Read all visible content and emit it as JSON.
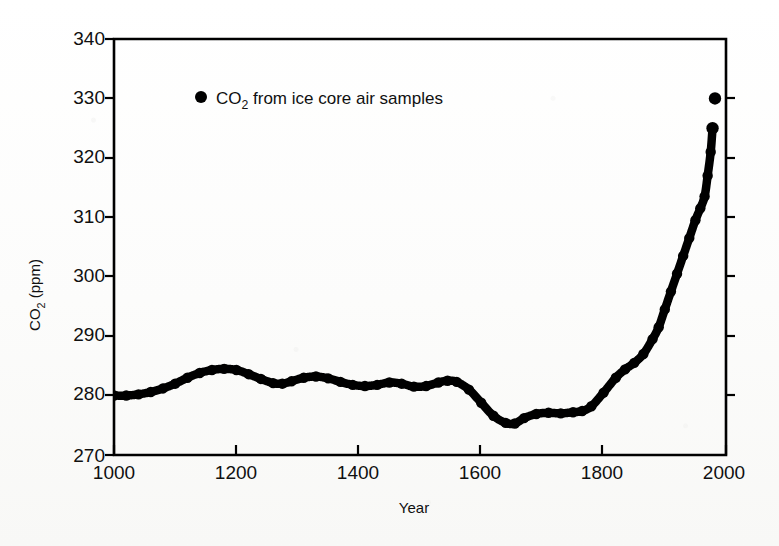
{
  "chart_data": {
    "type": "line",
    "title": "",
    "xlabel": "Year",
    "ylabel": "CO2 (ppm)",
    "ylabel_parts": {
      "main": "CO",
      "subscript": "2",
      "unit": " (ppm)"
    },
    "xlim": [
      1000,
      2000
    ],
    "ylim": [
      270,
      340
    ],
    "xticks": [
      1000,
      1200,
      1400,
      1600,
      1800,
      2000
    ],
    "yticks": [
      270,
      280,
      290,
      300,
      310,
      320,
      330,
      340
    ],
    "grid": false,
    "legend_position": "upper-left-inside",
    "series": [
      {
        "name": "CO2 from ice core air samples",
        "marker": "filled-circle",
        "color": "#000000",
        "x": [
          1000,
          1020,
          1040,
          1060,
          1080,
          1100,
          1120,
          1140,
          1160,
          1180,
          1200,
          1220,
          1240,
          1260,
          1275,
          1290,
          1310,
          1330,
          1350,
          1370,
          1390,
          1410,
          1430,
          1450,
          1470,
          1490,
          1510,
          1530,
          1545,
          1560,
          1580,
          1600,
          1620,
          1640,
          1655,
          1670,
          1690,
          1710,
          1730,
          1750,
          1765,
          1780,
          1800,
          1820,
          1835,
          1850,
          1865,
          1880,
          1890,
          1900,
          1910,
          1920,
          1930,
          1940,
          1950,
          1958,
          1965,
          1970,
          1975,
          1978
        ],
        "y": [
          280.0,
          280.0,
          280.2,
          280.6,
          281.2,
          282.0,
          283.0,
          283.8,
          284.3,
          284.5,
          284.3,
          283.6,
          282.8,
          282.1,
          282.0,
          282.4,
          283.0,
          283.2,
          282.9,
          282.3,
          281.8,
          281.6,
          281.8,
          282.2,
          282.0,
          281.5,
          281.6,
          282.2,
          282.5,
          282.3,
          281.0,
          278.8,
          276.6,
          275.4,
          275.3,
          276.2,
          276.9,
          277.1,
          277.0,
          277.2,
          277.4,
          278.2,
          280.5,
          283.0,
          284.4,
          285.5,
          287.0,
          289.5,
          291.5,
          294.5,
          297.5,
          300.5,
          303.5,
          306.5,
          309.5,
          311.5,
          313.5,
          317.0,
          321.0,
          325.0
        ],
        "terminal_points": [
          {
            "year": 1978,
            "value": 325.0
          },
          {
            "year": 1982,
            "value": 330.0
          }
        ]
      }
    ],
    "annotations": []
  },
  "legend": {
    "marker": "filled-circle",
    "label_main": "CO",
    "label_sub": "2",
    "label_rest": " from ice core air samples"
  },
  "axes": {
    "x_title": "Year",
    "y_title_main": "CO",
    "y_title_sub": "2",
    "y_title_rest": " (ppm)",
    "x_tick_labels": [
      "1000",
      "1200",
      "1400",
      "1600",
      "1800",
      "2000"
    ],
    "y_tick_labels": [
      "340",
      "330",
      "320",
      "310",
      "300",
      "290",
      "280",
      "270"
    ]
  },
  "colors": {
    "ink": "#000000",
    "paper": "#fdfdfc"
  }
}
